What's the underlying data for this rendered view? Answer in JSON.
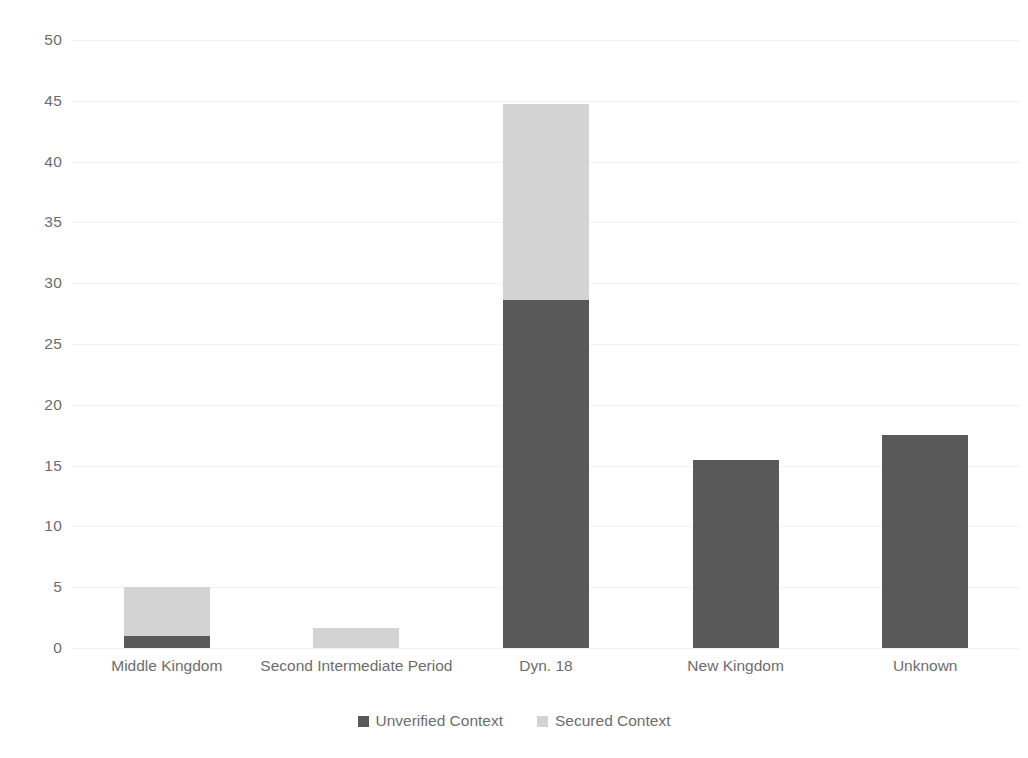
{
  "chart_data": {
    "type": "bar",
    "stacked": true,
    "title": "",
    "subtitle": "",
    "xlabel": "",
    "ylabel": "",
    "categories": [
      "Middle Kingdom",
      "Second Intermediate Period",
      "Dyn. 18",
      "New Kingdom",
      "Unknown"
    ],
    "series": [
      {
        "name": "Unverified Context",
        "color": "#595959",
        "values": [
          1,
          0,
          28.6,
          15.5,
          17.5
        ]
      },
      {
        "name": "Secured Context",
        "color": "#d3d3d3",
        "values": [
          4,
          1.65,
          16.1,
          0,
          0
        ]
      }
    ],
    "totals": [
      5,
      1.65,
      44.7,
      15.5,
      17.5
    ],
    "ylim": [
      0,
      50
    ],
    "y_ticks": [
      0,
      5,
      10,
      15,
      20,
      25,
      30,
      35,
      40,
      45,
      50
    ],
    "y_tick_labels": [
      "0",
      "5",
      "10",
      "15",
      "20",
      "25",
      "30",
      "35",
      "40",
      "45",
      "50"
    ],
    "grid": true,
    "grid_axis": "y",
    "legend_position": "bottom",
    "legend": [
      "Unverified Context",
      "Secured Context"
    ]
  },
  "colors": {
    "dark_gray": "#595959",
    "light_gray": "#d3d3d3",
    "gridline": "#f2f2f2",
    "text": "#6d6d6d",
    "background": "#ffffff"
  }
}
